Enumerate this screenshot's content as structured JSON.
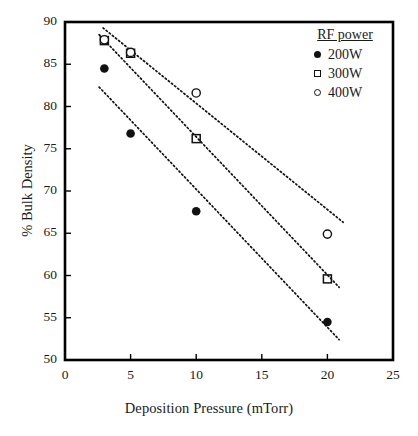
{
  "chart_data": {
    "type": "scatter",
    "title": "",
    "xlabel": "Deposition Pressure (mTorr)",
    "ylabel": "%  Bulk Density",
    "xlim": [
      0,
      25
    ],
    "ylim": [
      50,
      90
    ],
    "xticks": [
      0,
      5,
      10,
      15,
      20,
      25
    ],
    "yticks": [
      50,
      55,
      60,
      65,
      70,
      75,
      80,
      85,
      90
    ],
    "grid": false,
    "legend": {
      "title": "RF power",
      "position": "top-right",
      "entries": [
        {
          "label": "200W",
          "marker": "filled-circle"
        },
        {
          "label": "300W",
          "marker": "open-square"
        },
        {
          "label": "400W",
          "marker": "open-circle"
        }
      ]
    },
    "series": [
      {
        "name": "200W",
        "marker": "filled-circle",
        "x": [
          3,
          5,
          10,
          20
        ],
        "y": [
          84.5,
          76.8,
          67.6,
          54.5
        ],
        "trendline": {
          "x": [
            2.6,
            20.9
          ],
          "y": [
            82.3,
            52.4
          ]
        }
      },
      {
        "name": "300W",
        "marker": "open-square",
        "x": [
          3,
          5,
          10,
          20
        ],
        "y": [
          87.8,
          86.3,
          76.2,
          59.6
        ],
        "trendline": {
          "x": [
            2.6,
            20.9
          ],
          "y": [
            88.5,
            58.6
          ]
        }
      },
      {
        "name": "400W",
        "marker": "open-circle",
        "x": [
          3,
          5,
          10,
          20
        ],
        "y": [
          87.9,
          86.4,
          81.6,
          64.9
        ],
        "trendline": {
          "x": [
            2.9,
            21.2
          ],
          "y": [
            89.3,
            66.3
          ]
        }
      }
    ]
  },
  "colors": {
    "marker": "#111111",
    "axis": "#000000",
    "background": "#ffffff"
  }
}
